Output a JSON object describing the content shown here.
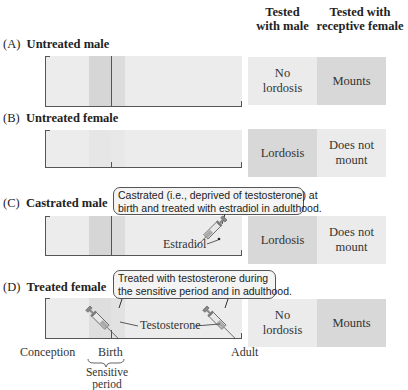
{
  "headers": {
    "col1": [
      "Tested",
      "with male"
    ],
    "col2": [
      "Tested with",
      "receptive female"
    ]
  },
  "rows": [
    {
      "letter": "(A)",
      "title": "Untreated male",
      "result_male": [
        "No",
        "lordosis"
      ],
      "result_female": [
        "Mounts"
      ],
      "male_shade": "light",
      "female_shade": "dark"
    },
    {
      "letter": "(B)",
      "title": "Untreated female",
      "result_male": [
        "Lordosis"
      ],
      "result_female": [
        "Does not",
        "mount"
      ],
      "male_shade": "dark",
      "female_shade": "light"
    },
    {
      "letter": "(C)",
      "title": "Castrated male",
      "result_male": [
        "Lordosis"
      ],
      "result_female": [
        "Does not",
        "mount"
      ],
      "male_shade": "dark",
      "female_shade": "light",
      "callout": [
        "Castrated (i.e., deprived of testosterone) at",
        "birth and treated with estradiol in adulthood."
      ],
      "injection_label": "Estradiol"
    },
    {
      "letter": "(D)",
      "title": "Treated female",
      "result_male": [
        "No",
        "lordosis"
      ],
      "result_female": [
        "Mounts"
      ],
      "male_shade": "light",
      "female_shade": "dark",
      "callout": [
        "Treated with testosterone during",
        "the sensitive period and in adulthood."
      ],
      "injection_label": "Testosterone"
    }
  ],
  "timeline": {
    "start": "Conception",
    "birth": "Birth",
    "end": "Adult",
    "sensitive_period": [
      "Sensitive",
      "period"
    ]
  },
  "colors": {
    "bar_bg": "#ececec",
    "sensitive_shade": "#d4d4d4",
    "result_light": "#ebebeb",
    "result_dark": "#d8d8d8"
  }
}
